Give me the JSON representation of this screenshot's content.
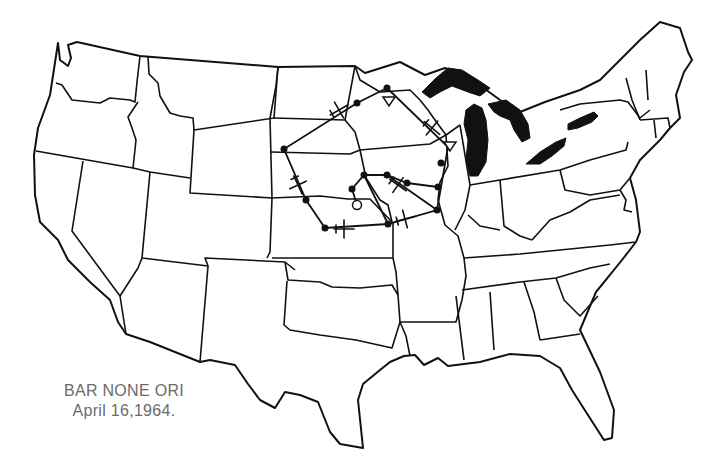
{
  "map": {
    "type": "outline-map",
    "region": "Contiguous United States",
    "line_color": "#111111",
    "lake_color": "#111111",
    "background": "#ffffff"
  },
  "caption": {
    "line1": "BAR NONE ORI",
    "line2": "April 16,1964.",
    "color": "#6b6b6b"
  },
  "route": {
    "description": "Flight path drawn over the Upper Midwest / Great Plains",
    "stops": [
      {
        "x": 387,
        "y": 88
      },
      {
        "x": 284,
        "y": 149
      },
      {
        "x": 306,
        "y": 200
      },
      {
        "x": 325,
        "y": 228
      },
      {
        "x": 364,
        "y": 175
      },
      {
        "x": 352,
        "y": 189
      },
      {
        "x": 387,
        "y": 175
      },
      {
        "x": 407,
        "y": 183
      },
      {
        "x": 438,
        "y": 187
      },
      {
        "x": 437,
        "y": 210
      },
      {
        "x": 388,
        "y": 224
      }
    ],
    "origin": {
      "x": 357,
      "y": 205
    },
    "turn_markers": [
      {
        "x": 389,
        "y": 101
      },
      {
        "x": 450,
        "y": 147
      }
    ]
  }
}
